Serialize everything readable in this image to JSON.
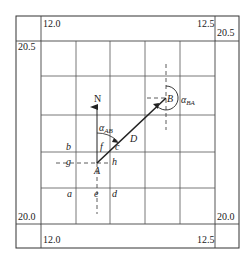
{
  "diagram": {
    "coordinate_labels": {
      "top_left_x": "12.0",
      "top_right_x": "12.5",
      "bottom_left_x": "12.0",
      "bottom_right_x": "12.5",
      "left_top_y": "20.5",
      "right_top_y": "20.5",
      "left_bottom_y": "20.0",
      "right_bottom_y": "20.0"
    },
    "north_label": "N",
    "points": {
      "A": "A",
      "B": "B",
      "C": "c",
      "D": "D"
    },
    "grid_labels": {
      "a": "a",
      "b": "b",
      "d": "d",
      "e": "e",
      "f": "f",
      "g": "g",
      "h": "h"
    },
    "angles": {
      "alpha_ab": {
        "symbol": "α",
        "subscript": "AB"
      },
      "alpha_ba": {
        "symbol": "α",
        "subscript": "BA"
      }
    },
    "colors": {
      "line": "#222222",
      "grid": "#555555",
      "background": "#ffffff"
    }
  }
}
